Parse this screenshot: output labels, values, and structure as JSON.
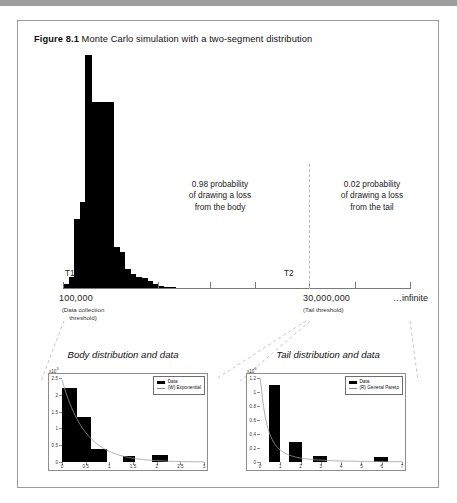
{
  "caption": {
    "number": "Figure 8.1",
    "text": "Monte Carlo simulation with a two-segment distribution"
  },
  "main": {
    "threshold_left_marker": "T1",
    "threshold_right_marker": "T2",
    "left_value": "100,000",
    "left_sub_line1": "(Data collection",
    "left_sub_line2": "threshold)",
    "right_value": "30,000,000",
    "right_sub": "(Tail threshold)",
    "infinite_label": "infinite",
    "body_prob_line1": "0.98 probability",
    "body_prob_line2": "of drawing a loss",
    "body_prob_line3": "from the body",
    "tail_prob_line1": "0.02 probability",
    "tail_prob_line2": "of drawing a loss",
    "tail_prob_line3": "from the tail"
  },
  "subcharts": {
    "body_title": "Body distribution and data",
    "tail_title": "Tail distribution and data"
  },
  "chart_data": [
    {
      "type": "bar",
      "name": "main-simulation-histogram",
      "title": "Monte Carlo simulation with a two-segment distribution",
      "xlabel": "",
      "ylabel": "",
      "grid": false,
      "axis_ticks": [
        "T1",
        "",
        "",
        "",
        "T2",
        "",
        "",
        "infinite"
      ],
      "x_annotations": [
        "100,000 (Data collection threshold)",
        "30,000,000 (Tail threshold)",
        "infinite"
      ],
      "annotations": [
        "0.98 probability of drawing a loss from the body",
        "0.02 probability of drawing a loss from the tail"
      ],
      "bin_width_px": 6,
      "categories": [
        0,
        1,
        2,
        3,
        4,
        5,
        6,
        7,
        8,
        9,
        10,
        11,
        12,
        13,
        14,
        15,
        16,
        17,
        18,
        19,
        20,
        21,
        22,
        23,
        24,
        25,
        26,
        27,
        28,
        29
      ],
      "values": [
        0.02,
        0.05,
        0.3,
        0.37,
        1.0,
        0.8,
        0.8,
        0.8,
        0.8,
        0.18,
        0.16,
        0.085,
        0.065,
        0.05,
        0.045,
        0.035,
        0.022,
        0.012,
        0.01,
        0.008,
        0.006,
        0.005,
        0.004,
        0.003,
        0.002,
        0.002,
        0.001,
        0.001,
        0.001,
        0.001
      ]
    },
    {
      "type": "bar",
      "name": "body-distribution-and-data",
      "title": "Body distribution and data",
      "y_multiplier": "x10",
      "ylim": [
        0,
        2.5
      ],
      "yticks": [
        0,
        0.5,
        1,
        1.5,
        2,
        2.5
      ],
      "ytick_labels": [
        "0",
        "0.5",
        "1",
        "1.5",
        "2",
        "2.5"
      ],
      "xlim": [
        0,
        3
      ],
      "xticks": [
        0,
        0.5,
        1,
        1.5,
        2,
        2.5,
        3
      ],
      "xtick_labels": [
        "0",
        "0.5",
        "1",
        "1.5",
        "2",
        "2.5",
        "3"
      ],
      "bar_edges": [
        0,
        0.32,
        0.62,
        0.95,
        1.28,
        1.55,
        1.9,
        2.25
      ],
      "bar_values": [
        2.2,
        1.35,
        0.38,
        0.0,
        0.17,
        0.0,
        0.2
      ],
      "curve_label": "(W) Exponential",
      "curve_type": "exponential",
      "legend": [
        "Data",
        "(W) Exponential"
      ],
      "legend_position": "upper right"
    },
    {
      "type": "bar",
      "name": "tail-distribution-and-data",
      "title": "Tail distribution and data",
      "y_multiplier": "x10",
      "ylim": [
        0,
        1.2
      ],
      "yticks": [
        0,
        0.2,
        0.4,
        0.6,
        0.8,
        1,
        1.2
      ],
      "ytick_labels": [
        "0",
        "0.2",
        "0.4",
        "0.6",
        "0.8",
        "1",
        "1.2"
      ],
      "xlim": [
        0,
        7
      ],
      "xticks": [
        0,
        1,
        2,
        3,
        4,
        5,
        6,
        7
      ],
      "xtick_labels": [
        "0",
        "1",
        "2",
        "3",
        "4",
        "5",
        "6",
        "7"
      ],
      "bar_edges": [
        0.45,
        1.0,
        1.45,
        2.05,
        2.6,
        3.3,
        4.0,
        5.6,
        6.3
      ],
      "bar_values": [
        1.1,
        0.0,
        0.28,
        0.0,
        0.08,
        0.0,
        0.0,
        0.07
      ],
      "curve_label": "(R) General Pareto",
      "curve_type": "pareto",
      "legend": [
        "Data",
        "(R) General Pareto"
      ],
      "legend_position": "upper right"
    }
  ]
}
